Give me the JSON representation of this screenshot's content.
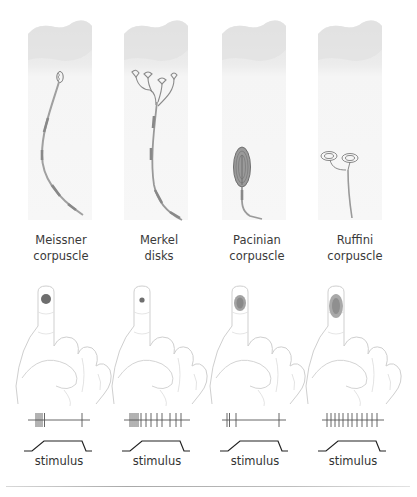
{
  "receptors": [
    {
      "id": "meissner",
      "name_line1": "Meissner",
      "name_line2": "corpuscle",
      "field": {
        "shape": "circle",
        "size": "small",
        "color": "#6e6e6e"
      },
      "spike_train": {
        "onset_spikes": 5,
        "offset_spikes": 1,
        "sustained_spikes": 0,
        "adaptation": "rapid"
      },
      "stimulus_label": "stimulus"
    },
    {
      "id": "merkel",
      "name_line1": "Merkel",
      "name_line2": "disks",
      "field": {
        "shape": "circle",
        "size": "tiny",
        "color": "#6e6e6e"
      },
      "spike_train": {
        "onset_spikes": 6,
        "offset_spikes": 0,
        "sustained_spikes": 6,
        "adaptation": "slow"
      },
      "stimulus_label": "stimulus"
    },
    {
      "id": "pacinian",
      "name_line1": "Pacinian",
      "name_line2": "corpuscle",
      "field": {
        "shape": "oval",
        "size": "large-diffuse",
        "color": "#8a8a8a"
      },
      "spike_train": {
        "onset_spikes": 3,
        "offset_spikes": 1,
        "sustained_spikes": 0,
        "adaptation": "rapid"
      },
      "stimulus_label": "stimulus"
    },
    {
      "id": "ruffini",
      "name_line1": "Ruffini",
      "name_line2": "corpuscle",
      "field": {
        "shape": "oval",
        "size": "large-diffuse",
        "color": "#8a8a8a"
      },
      "spike_train": {
        "onset_spikes": 1,
        "offset_spikes": 0,
        "sustained_spikes": 10,
        "adaptation": "slow"
      },
      "stimulus_label": "stimulus"
    }
  ],
  "colors": {
    "skin_top": "#e6e6e6",
    "skin_body": "#f4f4f4",
    "nerve": "#9a9a9a",
    "nerve_dark": "#7a7a7a",
    "hand_outline": "#cfcfcf",
    "trace": "#555555",
    "stimulus_line": "#222222"
  }
}
